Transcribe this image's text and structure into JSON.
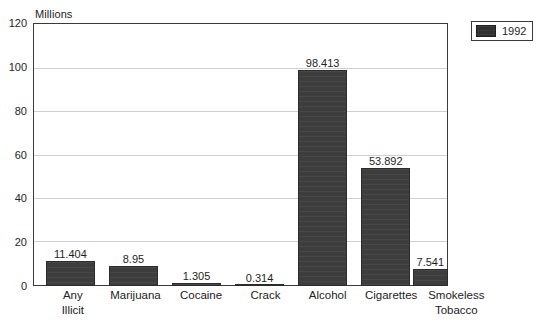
{
  "chart_data": {
    "type": "bar",
    "title": "",
    "subtitle": "",
    "unit_caption": "Millions",
    "xlabel": "",
    "ylabel": "",
    "ylim": [
      0,
      120
    ],
    "ytick_step": 20,
    "yticks": [
      "120",
      "100",
      "80",
      "60",
      "40",
      "20",
      "0"
    ],
    "ytick_values": [
      120,
      100,
      80,
      60,
      40,
      20,
      0
    ],
    "grid": true,
    "grid_axis": "y",
    "legend_position": "top-right",
    "categories": [
      "Any Illicit",
      "Marijuana",
      "Cocaine",
      "Crack",
      "Alcohol",
      "Cigarettes",
      "Smokeless Tobacco"
    ],
    "category_lines": [
      [
        "Any",
        "Illicit"
      ],
      [
        "Marijuana",
        ""
      ],
      [
        "Cocaine",
        ""
      ],
      [
        "Crack",
        ""
      ],
      [
        "Alcohol",
        ""
      ],
      [
        "Cigarettes",
        ""
      ],
      [
        "Smokeless",
        "Tobacco"
      ]
    ],
    "series": [
      {
        "name": "1992",
        "color": "#3d3d3d",
        "values": [
          11.404,
          8.95,
          1.305,
          0.314,
          98.413,
          53.892,
          7.541
        ],
        "value_labels": [
          "11.404",
          "8.95",
          "1.305",
          "0.314",
          "98.413",
          "53.892",
          "7.541"
        ]
      }
    ]
  },
  "legend": {
    "entries": [
      {
        "label": "1992",
        "color": "#3d3d3d"
      }
    ]
  },
  "colors": {
    "bar_fill": "#3d3d3d",
    "frame": "#3a3a3a",
    "gridline": "#cfcfcf",
    "background": "#ffffff",
    "text": "#1e1e1e"
  }
}
